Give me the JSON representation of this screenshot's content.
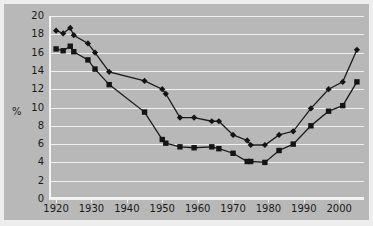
{
  "chart_data": {
    "type": "line",
    "title": "",
    "subtitle": "",
    "xlabel": "",
    "ylabel": "%",
    "xlim": [
      1918,
      2007
    ],
    "ylim": [
      0,
      20
    ],
    "grid": true,
    "legend_position": "none",
    "y_ticks": [
      0,
      2,
      4,
      6,
      8,
      10,
      12,
      14,
      16,
      18,
      20
    ],
    "y_tick_labels": [
      "0",
      "2",
      "4",
      "6",
      "8",
      "10",
      "12",
      "14",
      "16",
      "18",
      "20"
    ],
    "x_ticks": [
      1920,
      1930,
      1940,
      1950,
      1960,
      1970,
      1980,
      1990,
      2000
    ],
    "x_tick_labels": [
      "1920",
      "1930",
      "1940",
      "1950",
      "1960",
      "1970",
      "1980",
      "1990",
      "2000"
    ],
    "colors": {
      "background": "#b8b8b8",
      "outer_frame": "#ededed",
      "gridline": "#f0f0f0",
      "axis": "#f4f4f4",
      "series_line": "#1a1a1a",
      "marker": "#141414",
      "text": "#1a1a1a"
    },
    "series": [
      {
        "name": "series-diamond",
        "marker": "diamond",
        "x": [
          1920,
          1922,
          1924,
          1925,
          1929,
          1931,
          1935,
          1945,
          1950,
          1951,
          1955,
          1959,
          1964,
          1966,
          1970,
          1974,
          1975,
          1979,
          1983,
          1987,
          1992,
          1997,
          2001,
          2005
        ],
        "values": [
          18.4,
          18.1,
          18.7,
          17.9,
          17.0,
          16.0,
          13.9,
          12.9,
          12.0,
          11.5,
          8.9,
          8.9,
          8.5,
          8.5,
          7.0,
          6.4,
          5.9,
          5.9,
          7.0,
          7.4,
          9.9,
          12.0,
          12.8,
          16.3
        ]
      },
      {
        "name": "series-square",
        "marker": "square",
        "x": [
          1920,
          1922,
          1924,
          1925,
          1929,
          1931,
          1935,
          1945,
          1950,
          1951,
          1955,
          1959,
          1964,
          1966,
          1970,
          1974,
          1975,
          1979,
          1983,
          1987,
          1992,
          1997,
          2001,
          2005
        ],
        "values": [
          16.4,
          16.2,
          16.7,
          16.1,
          15.2,
          14.2,
          12.5,
          9.5,
          6.5,
          6.1,
          5.7,
          5.6,
          5.7,
          5.5,
          5.0,
          4.1,
          4.1,
          4.0,
          5.3,
          6.0,
          8.0,
          9.6,
          10.2,
          12.8
        ]
      }
    ]
  }
}
